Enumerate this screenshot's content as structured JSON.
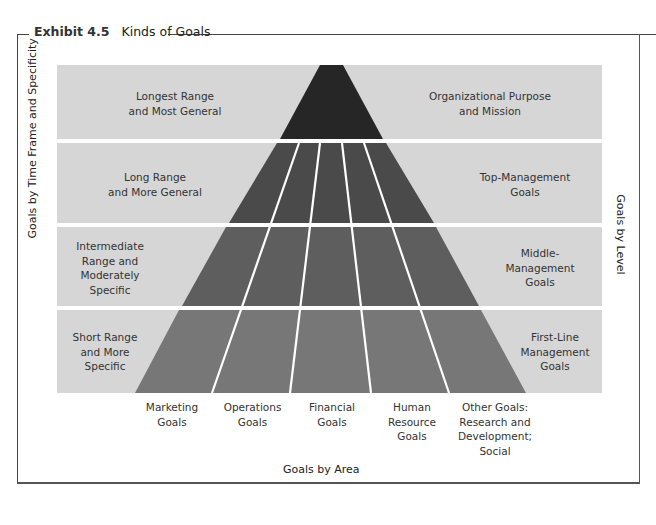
{
  "exhibit": {
    "number": "Exhibit 4.5",
    "title": "Kinds of Goals"
  },
  "axes": {
    "left": "Goals by Time Frame and Specificity",
    "right": "Goals by Level",
    "bottom": "Goals by Area"
  },
  "bands": [
    {
      "time_frame": [
        "Longest Range",
        "and Most General"
      ],
      "level": [
        "Organizational Purpose",
        "and Mission"
      ]
    },
    {
      "time_frame": [
        "Long Range",
        "and More General"
      ],
      "level": [
        "Top-Management",
        "Goals"
      ]
    },
    {
      "time_frame": [
        "Intermediate",
        "Range and",
        "Moderately",
        "Specific"
      ],
      "level": [
        "Middle-",
        "Management",
        "Goals"
      ]
    },
    {
      "time_frame": [
        "Short Range",
        "and More",
        "Specific"
      ],
      "level": [
        "First-Line",
        "Management",
        "Goals"
      ]
    }
  ],
  "areas": [
    {
      "label": [
        "Marketing",
        "Goals"
      ]
    },
    {
      "label": [
        "Operations",
        "Goals"
      ]
    },
    {
      "label": [
        "Financial",
        "Goals"
      ]
    },
    {
      "label": [
        "Human",
        "Resource",
        "Goals"
      ]
    },
    {
      "label": [
        "Other Goals:",
        "Research and",
        "Development;",
        "Social"
      ]
    }
  ],
  "colors": {
    "band_background": "#d6d6d6",
    "apex": "#262626",
    "tier2": "#4a4a4a",
    "tier3": "#5e5e5e",
    "tier4": "#777777",
    "divider": "#ffffff",
    "frame": "#444444"
  }
}
